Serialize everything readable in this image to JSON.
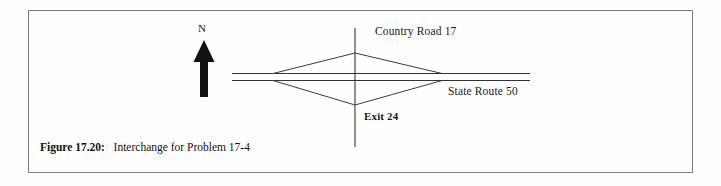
{
  "figure": {
    "caption_label": "Figure 17.20:",
    "caption_text": "Interchange for Problem 17-4",
    "frame_color": "#7d7d7d",
    "background_color": "#fefefe",
    "ink_color": "#1a1a1a"
  },
  "diagram": {
    "type": "diamond-interchange-map",
    "north_arrow_label": "N",
    "labels": {
      "country_road": "Country Road 17",
      "state_route": "State Route 50",
      "exit": "Exit 24"
    },
    "geometry": {
      "highway_left_x": 232,
      "highway_right_x": 530,
      "highway_line1_y": 73,
      "highway_line2_y": 80,
      "crossroad_x": 355,
      "crossroad_top_y": 28,
      "crossroad_bottom_y": 147,
      "ramp_top_apex_y": 53,
      "ramp_bottom_apex_y": 105,
      "ramp_left_x": 273,
      "ramp_right_x": 442,
      "north_arrow_x": 204,
      "north_arrow_top_y": 41,
      "north_arrow_bottom_y": 97
    }
  }
}
